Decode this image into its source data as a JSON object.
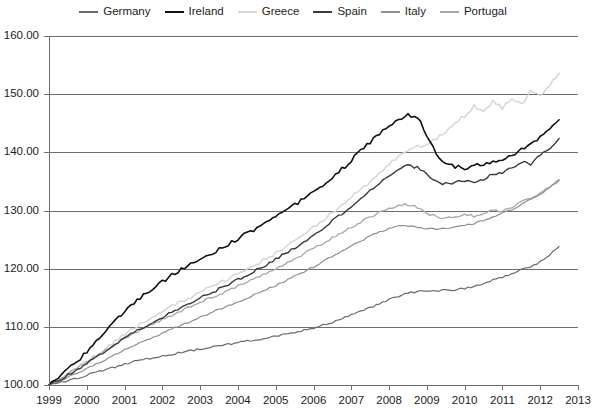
{
  "chart_data": {
    "type": "line",
    "title": "",
    "subtitle": "",
    "xlabel": "",
    "ylabel": "",
    "xlim": [
      1999,
      2013
    ],
    "ylim": [
      100,
      160
    ],
    "grid": true,
    "legend_position": "top-center",
    "y_ticks": [
      "100.00",
      "110.00",
      "120.00",
      "130.00",
      "140.00",
      "150.00",
      "160.00"
    ],
    "y_tick_values": [
      100,
      110,
      120,
      130,
      140,
      150,
      160
    ],
    "x_ticks": [
      "1999",
      "2000",
      "2001",
      "2002",
      "2003",
      "2004",
      "2005",
      "2006",
      "2007",
      "2008",
      "2009",
      "2010",
      "2011",
      "2012",
      "2013"
    ],
    "x_tick_values": [
      1999,
      2000,
      2001,
      2002,
      2003,
      2004,
      2005,
      2006,
      2007,
      2008,
      2009,
      2010,
      2011,
      2012,
      2013
    ],
    "colors": {
      "Germany": "#6b6b6b",
      "Ireland": "#111111",
      "Greece": "#d6d6d6",
      "Spain": "#3a3a3a",
      "Italy": "#8f8f8f",
      "Portugal": "#a8a8a8"
    },
    "series": [
      {
        "name": "Germany",
        "color": "#6b6b6b",
        "width": 1.2,
        "x": [
          1999.0,
          1999.25,
          1999.5,
          1999.75,
          2000.0,
          2000.25,
          2000.5,
          2000.75,
          2001.0,
          2001.25,
          2001.5,
          2001.75,
          2002.0,
          2002.25,
          2002.5,
          2002.75,
          2003.0,
          2003.25,
          2003.5,
          2003.75,
          2004.0,
          2004.25,
          2004.5,
          2004.75,
          2005.0,
          2005.25,
          2005.5,
          2005.75,
          2006.0,
          2006.25,
          2006.5,
          2006.75,
          2007.0,
          2007.25,
          2007.5,
          2007.75,
          2008.0,
          2008.25,
          2008.5,
          2008.75,
          2009.0,
          2009.25,
          2009.5,
          2009.75,
          2010.0,
          2010.25,
          2010.5,
          2010.75,
          2011.0,
          2011.25,
          2011.5,
          2011.75,
          2012.0,
          2012.25,
          2012.5
        ],
        "values": [
          100.0,
          100.3,
          100.8,
          101.2,
          101.7,
          102.2,
          102.6,
          103.1,
          103.6,
          104.1,
          104.4,
          104.7,
          105.0,
          105.3,
          105.6,
          105.9,
          106.2,
          106.5,
          106.7,
          107.0,
          107.3,
          107.6,
          107.8,
          108.1,
          108.4,
          108.7,
          109.0,
          109.4,
          109.8,
          110.3,
          110.8,
          111.4,
          112.0,
          112.6,
          113.3,
          114.0,
          114.7,
          115.3,
          115.8,
          116.1,
          116.2,
          116.2,
          116.3,
          116.4,
          116.6,
          117.0,
          117.5,
          118.0,
          118.6,
          119.2,
          119.8,
          120.3,
          121.2,
          122.4,
          123.8
        ]
      },
      {
        "name": "Ireland",
        "color": "#111111",
        "width": 1.6,
        "x": [
          1999.0,
          1999.25,
          1999.5,
          1999.75,
          2000.0,
          2000.25,
          2000.5,
          2000.75,
          2001.0,
          2001.25,
          2001.5,
          2001.75,
          2002.0,
          2002.25,
          2002.5,
          2002.75,
          2003.0,
          2003.25,
          2003.5,
          2003.75,
          2004.0,
          2004.25,
          2004.5,
          2004.75,
          2005.0,
          2005.25,
          2005.5,
          2005.75,
          2006.0,
          2006.25,
          2006.5,
          2006.75,
          2007.0,
          2007.25,
          2007.5,
          2007.75,
          2008.0,
          2008.25,
          2008.5,
          2008.75,
          2009.0,
          2009.25,
          2009.5,
          2009.75,
          2010.0,
          2010.25,
          2010.5,
          2010.75,
          2011.0,
          2011.25,
          2011.5,
          2011.75,
          2012.0,
          2012.25,
          2012.5
        ],
        "values": [
          100.0,
          101.2,
          102.6,
          104.1,
          105.8,
          107.5,
          109.2,
          110.9,
          112.6,
          114.1,
          115.4,
          116.6,
          117.8,
          118.9,
          119.9,
          120.8,
          121.6,
          122.4,
          123.3,
          124.2,
          125.1,
          126.1,
          127.0,
          127.9,
          128.8,
          129.8,
          130.9,
          132.0,
          133.2,
          134.4,
          135.7,
          137.1,
          138.6,
          140.2,
          141.8,
          143.3,
          144.6,
          145.6,
          146.4,
          146.2,
          143.0,
          139.8,
          138.2,
          137.6,
          137.3,
          137.6,
          138.0,
          138.4,
          138.9,
          139.5,
          140.4,
          141.5,
          142.6,
          143.8,
          145.6
        ]
      },
      {
        "name": "Greece",
        "color": "#d6d6d6",
        "width": 1.5,
        "x": [
          1999.0,
          1999.25,
          1999.5,
          1999.75,
          2000.0,
          2000.25,
          2000.5,
          2000.75,
          2001.0,
          2001.25,
          2001.5,
          2001.75,
          2002.0,
          2002.25,
          2002.5,
          2002.75,
          2003.0,
          2003.25,
          2003.5,
          2003.75,
          2004.0,
          2004.25,
          2004.5,
          2004.75,
          2005.0,
          2005.25,
          2005.5,
          2005.75,
          2006.0,
          2006.25,
          2006.5,
          2006.75,
          2007.0,
          2007.25,
          2007.5,
          2007.75,
          2008.0,
          2008.25,
          2008.5,
          2008.75,
          2009.0,
          2009.25,
          2009.5,
          2009.75,
          2010.0,
          2010.25,
          2010.5,
          2010.75,
          2011.0,
          2011.25,
          2011.5,
          2011.75,
          2012.0,
          2012.25,
          2012.5
        ],
        "values": [
          100.0,
          100.9,
          101.9,
          102.9,
          104.0,
          105.1,
          106.3,
          107.5,
          108.7,
          109.8,
          110.8,
          111.7,
          112.6,
          113.5,
          114.3,
          115.1,
          115.9,
          116.7,
          117.5,
          118.3,
          119.1,
          119.9,
          120.8,
          121.7,
          122.6,
          123.6,
          124.7,
          125.9,
          127.1,
          128.4,
          129.7,
          131.0,
          132.3,
          133.6,
          135.0,
          136.4,
          137.9,
          139.3,
          140.4,
          141.0,
          141.4,
          142.3,
          143.7,
          145.2,
          146.3,
          148.0,
          146.8,
          148.8,
          147.6,
          149.4,
          148.2,
          150.4,
          149.6,
          151.6,
          153.6
        ]
      },
      {
        "name": "Spain",
        "color": "#3a3a3a",
        "width": 1.4,
        "x": [
          1999.0,
          1999.25,
          1999.5,
          1999.75,
          2000.0,
          2000.25,
          2000.5,
          2000.75,
          2001.0,
          2001.25,
          2001.5,
          2001.75,
          2002.0,
          2002.25,
          2002.5,
          2002.75,
          2003.0,
          2003.25,
          2003.5,
          2003.75,
          2004.0,
          2004.25,
          2004.5,
          2004.75,
          2005.0,
          2005.25,
          2005.5,
          2005.75,
          2006.0,
          2006.25,
          2006.5,
          2006.75,
          2007.0,
          2007.25,
          2007.5,
          2007.75,
          2008.0,
          2008.25,
          2008.5,
          2008.75,
          2009.0,
          2009.25,
          2009.5,
          2009.75,
          2010.0,
          2010.25,
          2010.5,
          2010.75,
          2011.0,
          2011.25,
          2011.5,
          2011.75,
          2012.0,
          2012.25,
          2012.5
        ],
        "values": [
          100.0,
          100.8,
          101.7,
          102.7,
          103.7,
          104.8,
          105.9,
          107.0,
          108.1,
          109.1,
          110.0,
          110.9,
          111.7,
          112.5,
          113.3,
          114.1,
          114.9,
          115.7,
          116.5,
          117.3,
          118.1,
          118.9,
          119.8,
          120.7,
          121.6,
          122.6,
          123.6,
          124.7,
          125.8,
          127.0,
          128.2,
          129.4,
          130.7,
          132.0,
          133.3,
          134.6,
          135.9,
          137.0,
          137.8,
          137.4,
          136.2,
          134.9,
          134.6,
          134.8,
          135.1,
          135.0,
          135.4,
          136.2,
          136.6,
          137.3,
          138.4,
          138.0,
          139.6,
          140.4,
          142.4
        ]
      },
      {
        "name": "Italy",
        "color": "#8f8f8f",
        "width": 1.2,
        "x": [
          1999.0,
          1999.25,
          1999.5,
          1999.75,
          2000.0,
          2000.25,
          2000.5,
          2000.75,
          2001.0,
          2001.25,
          2001.5,
          2001.75,
          2002.0,
          2002.25,
          2002.5,
          2002.75,
          2003.0,
          2003.25,
          2003.5,
          2003.75,
          2004.0,
          2004.25,
          2004.5,
          2004.75,
          2005.0,
          2005.25,
          2005.5,
          2005.75,
          2006.0,
          2006.25,
          2006.5,
          2006.75,
          2007.0,
          2007.25,
          2007.5,
          2007.75,
          2008.0,
          2008.25,
          2008.5,
          2008.75,
          2009.0,
          2009.25,
          2009.5,
          2009.75,
          2010.0,
          2010.25,
          2010.5,
          2010.75,
          2011.0,
          2011.25,
          2011.5,
          2011.75,
          2012.0,
          2012.25,
          2012.5
        ],
        "values": [
          100.0,
          100.6,
          101.3,
          102.0,
          102.8,
          103.6,
          104.4,
          105.2,
          106.0,
          106.8,
          107.5,
          108.2,
          108.9,
          109.6,
          110.3,
          111.0,
          111.6,
          112.3,
          113.0,
          113.6,
          114.3,
          115.0,
          115.7,
          116.4,
          117.1,
          117.9,
          118.7,
          119.5,
          120.3,
          121.2,
          122.1,
          123.0,
          123.9,
          124.8,
          125.6,
          126.3,
          126.9,
          127.3,
          127.4,
          127.2,
          126.9,
          126.8,
          126.9,
          127.1,
          127.4,
          127.8,
          128.3,
          128.9,
          129.5,
          130.2,
          131.0,
          131.9,
          132.8,
          133.9,
          135.2
        ]
      },
      {
        "name": "Portugal",
        "color": "#a8a8a8",
        "width": 1.3,
        "x": [
          1999.0,
          1999.25,
          1999.5,
          1999.75,
          2000.0,
          2000.25,
          2000.5,
          2000.75,
          2001.0,
          2001.25,
          2001.5,
          2001.75,
          2002.0,
          2002.25,
          2002.5,
          2002.75,
          2003.0,
          2003.25,
          2003.5,
          2003.75,
          2004.0,
          2004.25,
          2004.5,
          2004.75,
          2005.0,
          2005.25,
          2005.5,
          2005.75,
          2006.0,
          2006.25,
          2006.5,
          2006.75,
          2007.0,
          2007.25,
          2007.5,
          2007.75,
          2008.0,
          2008.25,
          2008.5,
          2008.75,
          2009.0,
          2009.25,
          2009.5,
          2009.75,
          2010.0,
          2010.25,
          2010.5,
          2010.75,
          2011.0,
          2011.25,
          2011.5,
          2011.75,
          2012.0,
          2012.25,
          2012.5
        ],
        "values": [
          100.0,
          100.9,
          101.9,
          102.9,
          103.9,
          105.0,
          106.0,
          107.0,
          108.0,
          108.9,
          109.7,
          110.5,
          111.3,
          112.0,
          112.8,
          113.5,
          114.2,
          114.9,
          115.6,
          116.3,
          117.0,
          117.7,
          118.5,
          119.3,
          120.1,
          120.9,
          121.7,
          122.6,
          123.5,
          124.4,
          125.3,
          126.2,
          127.1,
          128.0,
          128.9,
          129.7,
          130.4,
          130.9,
          131.0,
          130.5,
          129.6,
          128.9,
          128.8,
          129.0,
          129.3,
          129.0,
          129.5,
          130.0,
          129.8,
          130.6,
          131.4,
          132.2,
          133.0,
          134.0,
          135.3
        ]
      }
    ]
  },
  "legend": {
    "items": [
      {
        "label": "Germany",
        "color": "#6b6b6b",
        "width": "2px"
      },
      {
        "label": "Ireland",
        "color": "#111111",
        "width": "2.5px"
      },
      {
        "label": "Greece",
        "color": "#d6d6d6",
        "width": "2px"
      },
      {
        "label": "Spain",
        "color": "#3a3a3a",
        "width": "2.5px"
      },
      {
        "label": "Italy",
        "color": "#8f8f8f",
        "width": "2px"
      },
      {
        "label": "Portugal",
        "color": "#a8a8a8",
        "width": "2px"
      }
    ]
  },
  "axes": {
    "y_labels": [
      "160.00",
      "150.00",
      "140.00",
      "130.00",
      "120.00",
      "110.00",
      "100.00"
    ],
    "x_labels": [
      "1999",
      "2000",
      "2001",
      "2002",
      "2003",
      "2004",
      "2005",
      "2006",
      "2007",
      "2008",
      "2009",
      "2010",
      "2011",
      "2012",
      "2013"
    ]
  }
}
